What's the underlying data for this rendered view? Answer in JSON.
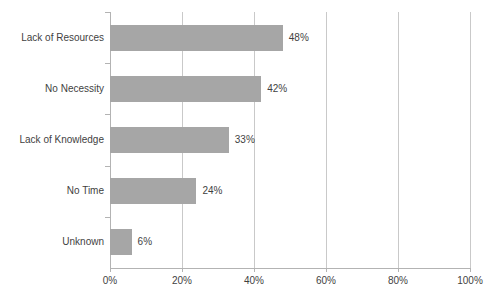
{
  "chart_data": {
    "type": "bar",
    "orientation": "horizontal",
    "title": "",
    "subtitle": "",
    "xlabel": "",
    "ylabel": "",
    "categories": [
      "Lack of Resources",
      "No Necessity",
      "Lack of Knowledge",
      "No Time",
      "Unknown"
    ],
    "values": [
      48,
      42,
      33,
      24,
      6
    ],
    "value_labels": [
      "48%",
      "42%",
      "33%",
      "24%",
      "6%"
    ],
    "xlim": [
      0,
      100
    ],
    "x_ticks": [
      0,
      20,
      40,
      60,
      80,
      100
    ],
    "x_tick_labels": [
      "0%",
      "20%",
      "40%",
      "60%",
      "80%",
      "100%"
    ],
    "grid": "vertical",
    "legend": "none",
    "bar_color": "#a6a6a6",
    "gridline_color": "#c9c9c9",
    "axis_color": "#b3b3b3",
    "text_color": "#3f3f3f",
    "background_color": "#ffffff"
  }
}
